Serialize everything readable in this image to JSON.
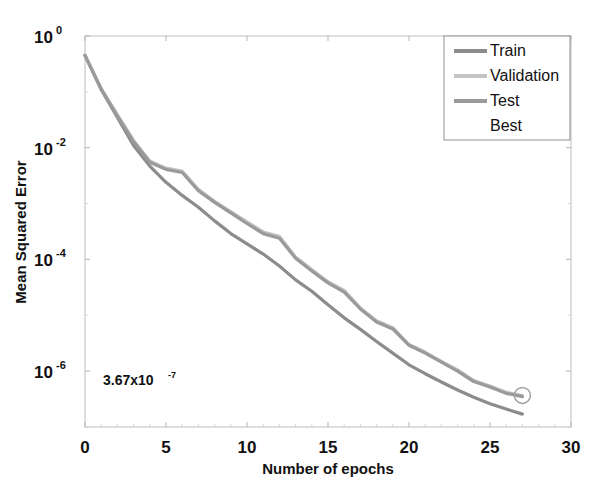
{
  "chart_data": {
    "type": "line",
    "title": "",
    "xlabel": "Number of epochs",
    "ylabel": "Mean Squared Error",
    "yscale": "log",
    "xlim": [
      0,
      30
    ],
    "ylim": [
      1e-07,
      1
    ],
    "grid": false,
    "legend_position": "top-right",
    "xticks": [
      "0",
      "5",
      "10",
      "15",
      "20",
      "25",
      "30"
    ],
    "xtick_values": [
      0,
      5,
      10,
      15,
      20,
      25,
      30
    ],
    "yticks": [
      "10^0",
      "10^-2",
      "10^-4",
      "10^-6"
    ],
    "ytick_values": [
      1,
      0.01,
      0.0001,
      1e-06
    ],
    "ytick_mantissa": [
      "10",
      "10",
      "10",
      "10"
    ],
    "ytick_exponent": [
      "0",
      "-2",
      "-4",
      "-6"
    ],
    "annotation": {
      "text": "3.67x10",
      "exponent": "-7",
      "x_epoch": 1.6,
      "y_value": 7e-07
    },
    "best_marker": {
      "label": "Best",
      "epoch": 27.0,
      "value": 3.67e-07,
      "shape": "circle"
    },
    "x": [
      0,
      1,
      2,
      3,
      4,
      5,
      6,
      7,
      8,
      9,
      10,
      11,
      12,
      13,
      14,
      15,
      16,
      17,
      18,
      19,
      20,
      21,
      22,
      23,
      24,
      25,
      26,
      27
    ],
    "series": [
      {
        "name": "Train",
        "color": "#8c8c8c",
        "values": [
          0.45,
          0.11,
          0.035,
          0.011,
          0.0047,
          0.0024,
          0.0014,
          0.00086,
          0.00049,
          0.00029,
          0.00019,
          0.000125,
          7.6e-05,
          4.3e-05,
          2.7e-05,
          1.55e-05,
          9e-06,
          5.6e-06,
          3.4e-06,
          2.1e-06,
          1.3e-06,
          9e-07,
          6.4e-07,
          4.6e-07,
          3.4e-07,
          2.6e-07,
          2.1e-07,
          1.7e-07
        ]
      },
      {
        "name": "Validation",
        "color": "#c4c4c4",
        "values": [
          0.45,
          0.115,
          0.039,
          0.0135,
          0.0058,
          0.0043,
          0.0038,
          0.0018,
          0.0011,
          0.00072,
          0.00047,
          0.00031,
          0.00026,
          0.00011,
          6.6e-05,
          4e-05,
          2.8e-05,
          1.35e-05,
          8e-06,
          6e-06,
          3e-06,
          2.2e-06,
          1.5e-06,
          1.05e-06,
          6.8e-07,
          5.4e-07,
          4.2e-07,
          3.67e-07
        ]
      },
      {
        "name": "Test",
        "color": "#9a9a9a",
        "values": [
          0.45,
          0.112,
          0.037,
          0.0128,
          0.0055,
          0.0041,
          0.0036,
          0.0017,
          0.00105,
          0.00068,
          0.00044,
          0.00029,
          0.00024,
          0.000105,
          6.2e-05,
          3.8e-05,
          2.6e-05,
          1.3e-05,
          7.6e-06,
          5.7e-06,
          2.9e-06,
          2.1e-06,
          1.45e-06,
          1e-06,
          6.5e-07,
          5.2e-07,
          4e-07,
          3.5e-07
        ]
      }
    ]
  },
  "legend": {
    "entries": [
      {
        "label": "Train",
        "color": "#8c8c8c",
        "has_line": true
      },
      {
        "label": "Validation",
        "color": "#c4c4c4",
        "has_line": true
      },
      {
        "label": "Test",
        "color": "#9a9a9a",
        "has_line": true
      },
      {
        "label": "Best",
        "color": "#6e6e6e",
        "has_line": false
      }
    ]
  },
  "axes": {
    "x_label": "Number of epochs",
    "y_label": "Mean Squared Error",
    "frame_color": "#c8c8c8",
    "text_color": "#111111"
  }
}
